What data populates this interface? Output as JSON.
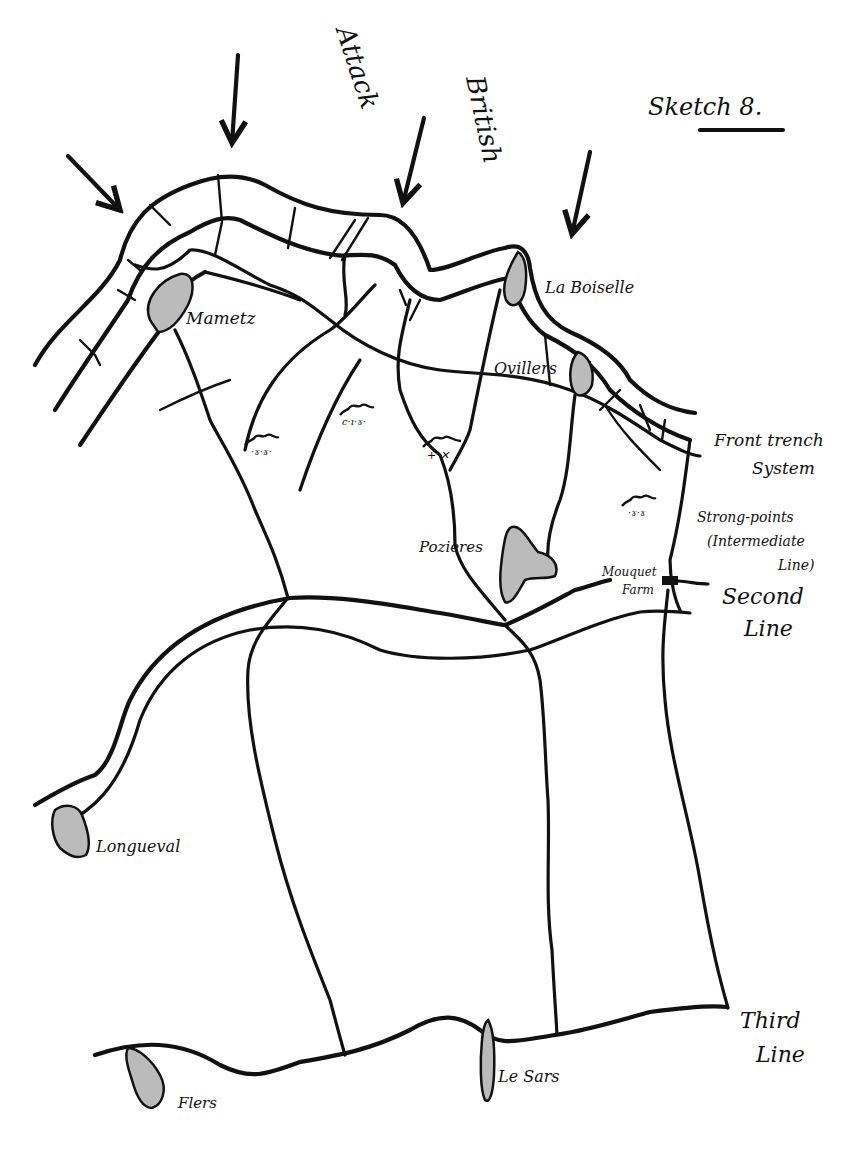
{
  "title": "Sketch 8.",
  "attack_label": {
    "word1": "British",
    "word2": "Attack"
  },
  "villages": [
    {
      "name": "Mametz"
    },
    {
      "name": "La Boiselle"
    },
    {
      "name": "Ovillers"
    },
    {
      "name": "Pozières"
    },
    {
      "name": "Mouquet Farm",
      "line1": "Mouquet",
      "line2": "Farm"
    },
    {
      "name": "Longueval"
    },
    {
      "name": "Flers"
    },
    {
      "name": "Le Sars"
    }
  ],
  "lines": {
    "front": {
      "line1": "Front trench",
      "line2": "System"
    },
    "intermediate": {
      "line1": "Strong-points",
      "line2": "(Intermediate",
      "line3": "Line)"
    },
    "second": {
      "line1": "Second",
      "line2": "Line"
    },
    "third": {
      "line1": "Third",
      "line2": "Line"
    }
  },
  "colors": {
    "ink": "#111111",
    "paper": "#ffffff",
    "hatch_fill": "#bbbbbb"
  }
}
